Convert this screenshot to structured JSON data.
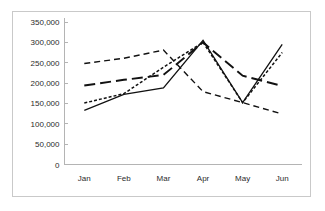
{
  "chart_data": {
    "type": "line",
    "title": "",
    "subtitle": "",
    "xlabel": "",
    "ylabel": "",
    "categories": [
      "Jan",
      "Feb",
      "Mar",
      "Apr",
      "May",
      "Jun"
    ],
    "ylim": [
      0,
      350000
    ],
    "yticks": [
      0,
      50000,
      100000,
      150000,
      200000,
      250000,
      300000,
      350000
    ],
    "ytick_labels": [
      "0",
      "50,000",
      "100,000",
      "150,000",
      "200,000",
      "250,000",
      "300,000",
      "350,000"
    ],
    "grid": false,
    "legend": "none",
    "series": [
      {
        "name": "series-1",
        "style": "solid",
        "values": [
          133000,
          172000,
          188000,
          305000,
          152000,
          295000
        ]
      },
      {
        "name": "series-2",
        "style": "fine-dash",
        "values": [
          151000,
          174000,
          239000,
          300000,
          152000,
          275000
        ]
      },
      {
        "name": "series-3",
        "style": "long-dash",
        "values": [
          194000,
          208000,
          220000,
          300000,
          218000,
          193000
        ]
      },
      {
        "name": "series-4",
        "style": "medium-dash",
        "values": [
          248000,
          261000,
          281000,
          179000,
          152000,
          124000
        ]
      }
    ],
    "colors": {
      "line": "#111111",
      "axis": "#b4b4b4",
      "text": "#2b2b2b",
      "border": "#c9c9c9",
      "background": "#ffffff"
    }
  }
}
